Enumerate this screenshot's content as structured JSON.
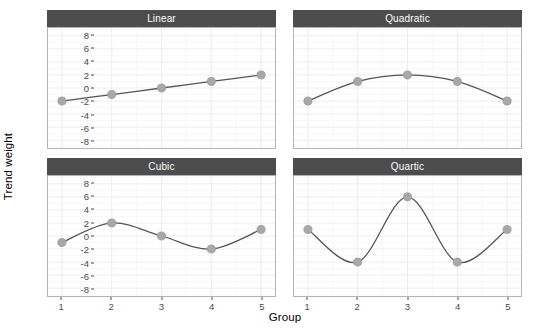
{
  "chart_data": {
    "type": "line",
    "title": "",
    "xlabel": "Group",
    "ylabel": "Trend weight",
    "x": [
      1,
      2,
      3,
      4,
      5
    ],
    "xticklabels": [
      "1",
      "2",
      "3",
      "4",
      "5"
    ],
    "yticklabels": [
      "8",
      "6",
      "4",
      "2",
      "0",
      "-2",
      "-4",
      "-6",
      "-8"
    ],
    "yticks": [
      8,
      6,
      4,
      2,
      0,
      -2,
      -4,
      -6,
      -8
    ],
    "xlim": [
      0.72,
      5.28
    ],
    "ylim": [
      -9.2,
      9.2
    ],
    "grid": true,
    "legend": "none",
    "facets": [
      {
        "label": "Linear",
        "row": 0,
        "col": 0,
        "categories": [
          "1",
          "2",
          "3",
          "4",
          "5"
        ],
        "values": [
          -2,
          -1,
          0,
          1,
          2
        ]
      },
      {
        "label": "Quadratic",
        "row": 0,
        "col": 1,
        "categories": [
          "1",
          "2",
          "3",
          "4",
          "5"
        ],
        "values": [
          -2,
          1,
          2,
          1,
          -2
        ]
      },
      {
        "label": "Cubic",
        "row": 1,
        "col": 0,
        "categories": [
          "1",
          "2",
          "3",
          "4",
          "5"
        ],
        "values": [
          -1,
          2,
          0,
          -2,
          1
        ]
      },
      {
        "label": "Quartic",
        "row": 1,
        "col": 1,
        "categories": [
          "1",
          "2",
          "3",
          "4",
          "5"
        ],
        "values": [
          1,
          -4,
          6,
          -4,
          1
        ]
      }
    ],
    "colors": {
      "line": "#555555",
      "point_fill": "#a8a8a8",
      "point_stroke": "#9a9a9a",
      "panel_background": "#ffffff",
      "panel_border": "#b4b4b4",
      "gridline_major": "#ededed",
      "gridline_minor": "#f6f6f6",
      "strip_background": "#4d4d4d",
      "strip_text": "#ffffff",
      "axis_text": "#4d4d4d",
      "axis_title": "#000000"
    }
  }
}
